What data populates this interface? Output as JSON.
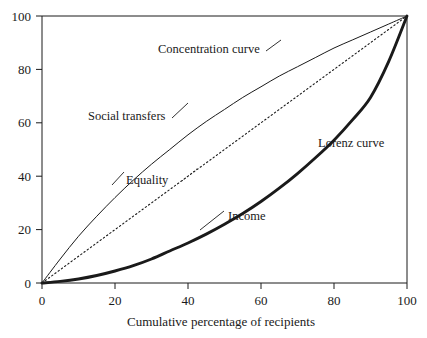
{
  "chart_data": {
    "type": "line",
    "title": "",
    "subtitle": "",
    "xlabel": "Cumulative percentage of recipients",
    "ylabel": "",
    "xlim": [
      0,
      100
    ],
    "ylim": [
      0,
      100
    ],
    "grid": false,
    "legend_position": "inline-annotations",
    "xticks": [
      0,
      20,
      40,
      60,
      80,
      100
    ],
    "yticks": [
      0,
      20,
      40,
      60,
      80,
      100
    ],
    "xtick_labels": [
      "0",
      "20",
      "40",
      "60",
      "80",
      "100"
    ],
    "ytick_labels": [
      "0",
      "20",
      "40",
      "60",
      "80",
      "100"
    ],
    "series": [
      {
        "name": "Concentration curve",
        "style": "thin-solid",
        "color": "#1a1a1a",
        "x": [
          0,
          5,
          10,
          15,
          20,
          25,
          30,
          35,
          40,
          45,
          50,
          55,
          60,
          65,
          70,
          75,
          80,
          85,
          90,
          95,
          100
        ],
        "values": [
          0,
          9,
          17.5,
          25,
          32,
          38.5,
          44.5,
          50,
          55.5,
          60.5,
          65,
          69.5,
          73.5,
          77.5,
          81,
          84.5,
          88,
          91,
          94,
          97,
          100
        ]
      },
      {
        "name": "Equality",
        "style": "dotted",
        "color": "#1a1a1a",
        "x": [
          0,
          100
        ],
        "values": [
          0,
          100
        ]
      },
      {
        "name": "Lorenz curve",
        "style": "thick-solid",
        "color": "#1a1a1a",
        "x": [
          0,
          5,
          10,
          15,
          20,
          25,
          30,
          35,
          40,
          45,
          50,
          55,
          60,
          65,
          70,
          75,
          80,
          85,
          90,
          95,
          100
        ],
        "values": [
          0,
          0.6,
          1.5,
          2.8,
          4.5,
          6.5,
          9,
          12,
          15,
          18.3,
          22,
          26,
          30.5,
          35.5,
          41,
          47,
          53.5,
          61,
          69.5,
          83,
          100
        ]
      }
    ],
    "annotations": [
      {
        "text": "Concentration curve",
        "x": 32,
        "y": 86.5,
        "anchor": "start"
      },
      {
        "text": "Social transfers",
        "x": 13,
        "y": 61.5,
        "anchor": "start"
      },
      {
        "text": "Equality",
        "x": 23,
        "y": 37,
        "anchor": "start"
      },
      {
        "text": "Lorenz curve",
        "x": 78,
        "y": 55,
        "anchor": "start"
      },
      {
        "text": "Income",
        "x": 51,
        "y": 23,
        "anchor": "start"
      }
    ]
  },
  "figure": {
    "xaxis_title": "Cumulative percentage of recipients",
    "annotation_concentration": "Concentration curve",
    "annotation_social_transfers": "Social transfers",
    "annotation_equality": "Equality",
    "annotation_lorenz": "Lorenz curve",
    "annotation_income": "Income",
    "ytick_0": "0",
    "ytick_20": "20",
    "ytick_40": "40",
    "ytick_60": "60",
    "ytick_80": "80",
    "ytick_100": "100",
    "xtick_0": "0",
    "xtick_20": "20",
    "xtick_40": "40",
    "xtick_60": "60",
    "xtick_80": "80",
    "xtick_100": "100"
  }
}
